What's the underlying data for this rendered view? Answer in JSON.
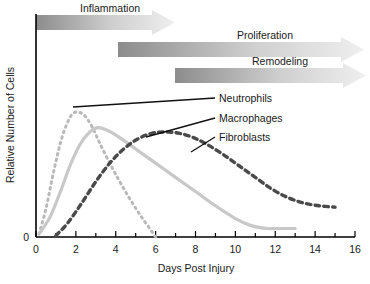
{
  "chart_data": {
    "type": "line",
    "title": "",
    "xlabel": "Days Post Injury",
    "ylabel": "Relative Number of Cells",
    "xlim": [
      0,
      16
    ],
    "ylim": [
      0,
      100
    ],
    "grid": false,
    "legend_position": "inline-callouts",
    "xticks": [
      0,
      1,
      2,
      3,
      4,
      5,
      6,
      7,
      8,
      9,
      10,
      11,
      12,
      13,
      14,
      15,
      16
    ],
    "xtick_labels": [
      "0",
      "",
      "2",
      "",
      "4",
      "",
      "6",
      "",
      "8",
      "",
      "10",
      "",
      "12",
      "",
      "14",
      "",
      "16"
    ],
    "yticks": [
      0
    ],
    "ytick_labels": [
      "0"
    ],
    "series": [
      {
        "name": "Neutrophils",
        "style": "dotted",
        "color": "#b9b9b9",
        "x": [
          0.15,
          0.5,
          0.9,
          1.3,
          1.7,
          2.0,
          2.4,
          2.8,
          3.2,
          3.7,
          4.2,
          4.7,
          5.2,
          5.7,
          6.0
        ],
        "values": [
          2,
          20,
          47,
          70,
          84,
          88,
          86,
          78,
          66,
          52,
          39,
          27,
          16,
          6,
          0
        ]
      },
      {
        "name": "Macrophages",
        "style": "solid",
        "color": "#c8c8c8",
        "x": [
          0.2,
          0.7,
          1.2,
          1.7,
          2.2,
          2.7,
          3.1,
          3.6,
          4.2,
          5.0,
          6.0,
          7.0,
          8.0,
          9.0,
          10.0,
          10.8,
          11.6,
          12.4,
          13.0
        ],
        "values": [
          3,
          14,
          31,
          50,
          65,
          74,
          77,
          75,
          70,
          62,
          52,
          42,
          32,
          22,
          13,
          8,
          6,
          6,
          6
        ]
      },
      {
        "name": "Fibroblasts",
        "style": "dashed",
        "color": "#4a4a4a",
        "x": [
          1.0,
          1.6,
          2.3,
          3.0,
          3.7,
          4.4,
          5.1,
          5.8,
          6.5,
          7.2,
          7.9,
          8.6,
          9.4,
          10.2,
          11.0,
          11.8,
          12.6,
          13.4,
          14.2,
          15.0
        ],
        "values": [
          1,
          10,
          24,
          39,
          52,
          62,
          69,
          73,
          74,
          73,
          70,
          65,
          58,
          50,
          42,
          34,
          28,
          24,
          22,
          21
        ]
      }
    ],
    "phases": [
      {
        "label": "Inflammation",
        "start": 0.0,
        "end": 6.4
      },
      {
        "label": "Proliferation",
        "start": 3.3,
        "end": 16.0
      },
      {
        "label": "Remodeling",
        "start": 6.2,
        "end": 16.4
      }
    ],
    "callouts": [
      {
        "label": "Neutrophils",
        "target_x": 2.3,
        "target_y": 83
      },
      {
        "label": "Macrophages",
        "target_x": 4.5,
        "target_y": 62
      },
      {
        "label": "Fibroblasts",
        "target_x": 6.4,
        "target_y": 64
      }
    ]
  },
  "axes": {
    "origin_label": "0",
    "x_title": "Days Post Injury",
    "y_title": "Relative Number of Cells"
  },
  "colors": {
    "axis": "#000000",
    "arrow_dark": "#8f8f8f",
    "arrow_light": "#e8e8e8",
    "neutrophils": "#b9b9b9",
    "macrophages": "#c8c8c8",
    "fibroblasts": "#4a4a4a",
    "text": "#1a1a1a"
  }
}
